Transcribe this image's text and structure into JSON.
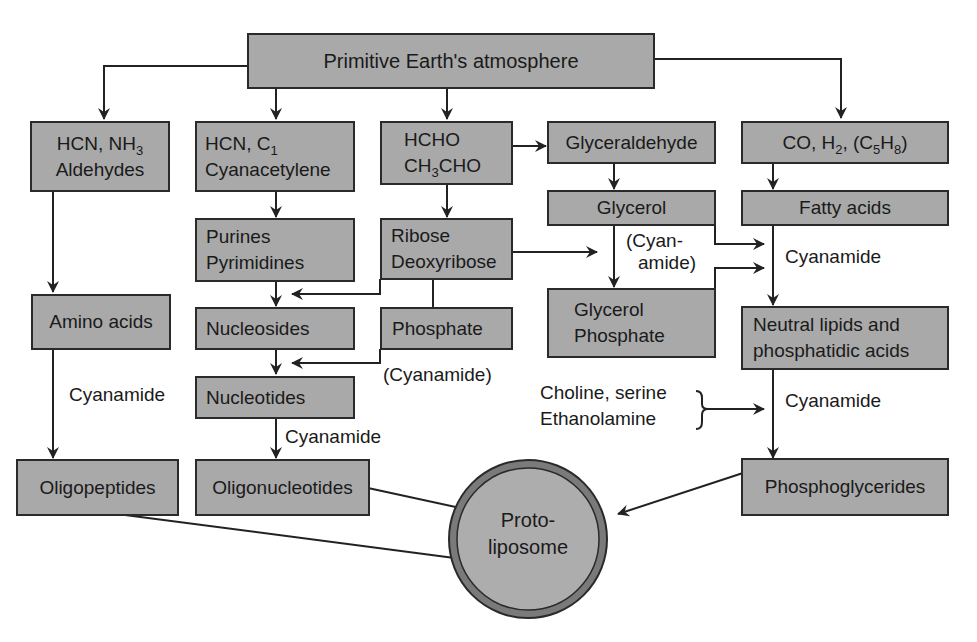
{
  "diagram": {
    "root": {
      "label": "Primitive Earth's atmosphere"
    },
    "nodes": {
      "hcn_nh3": {
        "line1": "HCN, NH",
        "line1_sub": "3",
        "line2": "Aldehydes"
      },
      "hcn_c1": {
        "line1": "HCN, C",
        "line1_sub": "1",
        "line2": "Cyanacetylene"
      },
      "hcho": {
        "line1": "HCHO",
        "line2_a": "CH",
        "line2_sub": "3",
        "line2_b": "CHO"
      },
      "glyceraldehyde": {
        "label": "Glyceraldehyde"
      },
      "co_h2": {
        "a": "CO, H",
        "sub1": "2",
        "b": ", (C",
        "sub2": "5",
        "c": "H",
        "sub3": "8",
        "d": ")"
      },
      "purines": {
        "line1": "Purines",
        "line2": "Pyrimidines"
      },
      "ribose": {
        "line1": "Ribose",
        "line2": "Deoxyribose"
      },
      "glycerol": {
        "label": "Glycerol"
      },
      "fatty_acids": {
        "label": "Fatty acids"
      },
      "amino_acids": {
        "label": "Amino acids"
      },
      "nucleosides": {
        "label": "Nucleosides"
      },
      "phosphate": {
        "label": "Phosphate"
      },
      "glycerol_phosphate": {
        "line1": "Glycerol",
        "line2": "Phosphate"
      },
      "neutral_lipids": {
        "line1": "Neutral lipids and",
        "line2": "phosphatidic acids"
      },
      "nucleotides": {
        "label": "Nucleotides"
      },
      "oligopeptides": {
        "label": "Oligopeptides"
      },
      "oligonucleotides": {
        "label": "Oligonucleotides"
      },
      "phosphoglycerides": {
        "label": "Phosphoglycerides"
      },
      "protoliposome": {
        "line1": "Proto-",
        "line2": "liposome"
      }
    },
    "annotations": {
      "cyanamide_amino": "Cyanamide",
      "cyanamide_phosphate": "(Cyanamide)",
      "cyanamide_nucleotides": "Cyanamide",
      "cyanamide_glycerol_1": "(Cyan-",
      "cyanamide_glycerol_2": "amide)",
      "cyanamide_fatty": "Cyanamide",
      "cyanamide_lipids": "Cyanamide",
      "choline_1": "Choline, serine",
      "choline_2": "Ethanolamine"
    },
    "colors": {
      "box_fill": "#a9a9a9",
      "box_border": "#2a2a2a",
      "line": "#222222",
      "circle_ring": "#7a7a7a"
    }
  }
}
